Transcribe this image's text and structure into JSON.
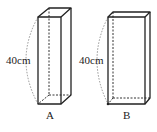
{
  "diagram": {
    "type": "rectangular-prisms",
    "prisms": [
      {
        "id": "A",
        "label": "A",
        "height_label": "40cm",
        "front": {
          "x1": 38,
          "y1": 17,
          "x2": 61,
          "y2": 104
        },
        "back_offset": {
          "dx": 11,
          "dy": -9
        }
      },
      {
        "id": "B",
        "label": "B",
        "height_label": "40cm",
        "front": {
          "x1": 108,
          "y1": 17,
          "x2": 145,
          "y2": 104
        },
        "back_offset": {
          "dx": 5,
          "dy": -5
        }
      }
    ],
    "colors": {
      "stroke": "#222222",
      "dashed": "#333333",
      "arc": "#888888"
    }
  }
}
